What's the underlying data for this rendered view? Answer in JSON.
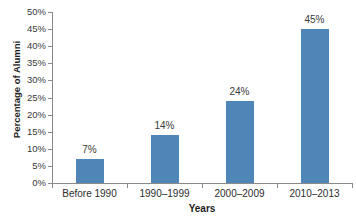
{
  "chart_data": {
    "type": "bar",
    "title": "Businesses After Graduation",
    "xlabel": "Years",
    "ylabel": "Percentage of Alumni",
    "categories": [
      "Before 1990",
      "1990–1999",
      "2000–2009",
      "2010–2013"
    ],
    "values": [
      7,
      14,
      24,
      45
    ],
    "data_labels": [
      "7%",
      "14%",
      "24%",
      "45%"
    ],
    "ylim": [
      0,
      50
    ],
    "ytick_values": [
      0,
      5,
      10,
      15,
      20,
      25,
      30,
      35,
      40,
      45,
      50
    ],
    "ytick_labels": [
      "0%",
      "5%",
      "10%",
      "15%",
      "20%",
      "25%",
      "30%",
      "35%",
      "40%",
      "45%",
      "50%"
    ],
    "grid": false,
    "legend": false,
    "series": [
      {
        "name": "Percentage of Alumni",
        "values": [
          7,
          14,
          24,
          45
        ]
      }
    ],
    "colors": {
      "bar": "#4e86b8",
      "axis": "#8a8a8a",
      "text": "#333333",
      "background": "#ffffff"
    }
  }
}
